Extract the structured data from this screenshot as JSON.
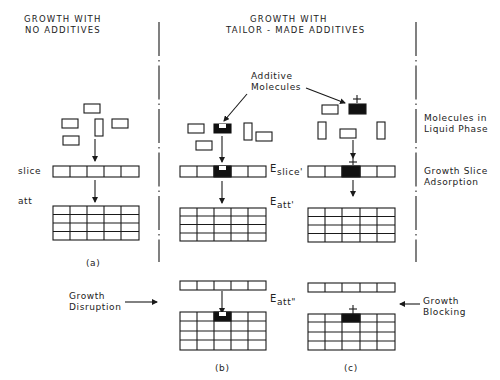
{
  "headers": {
    "left_line1": "GROWTH  WITH",
    "left_line2": "NO  ADDITIVES",
    "center_line1": "GROWTH  WITH",
    "center_line2": "TAILOR - MADE  ADDITIVES"
  },
  "row_labels": {
    "slice": "slice",
    "att": "att"
  },
  "annotations": {
    "additive_molecules_1": "Additive",
    "additive_molecules_2": "Molecules",
    "molecules_liquid_1": "Molecules in",
    "molecules_liquid_2": "Liquid Phase",
    "growth_slice_1": "Growth Slice",
    "growth_slice_2": "Adsorption",
    "growth_disruption_1": "Growth",
    "growth_disruption_2": "Disruption",
    "growth_blocking_1": "Growth",
    "growth_blocking_2": "Blocking"
  },
  "energy_labels": {
    "e_slice": "E",
    "e_slice_sub": "slice'",
    "e_att": "E",
    "e_att_sub": "att'",
    "e_att2": "E",
    "e_att2_sub": "att\""
  },
  "panel_captions": {
    "a": "(a)",
    "b": "(b)",
    "c": "(c)"
  },
  "symbols": {
    "plus": "+"
  },
  "colors": {
    "ink": "#1a1a1a",
    "background": "#ffffff",
    "additive_fill": "#111111"
  }
}
